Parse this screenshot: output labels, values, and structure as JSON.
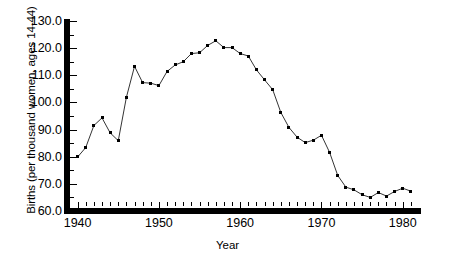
{
  "chart_data": {
    "type": "line",
    "title": "",
    "xlabel": "Year",
    "ylabel": "Births (per thousand women, ages 14-44)",
    "xlim": [
      1939.0,
      1982.0
    ],
    "ylim": [
      60.0,
      130.0
    ],
    "grid": false,
    "legend": "none",
    "marker": "square",
    "line_color": "#000000",
    "marker_color": "#000000",
    "x_tick_labels": [
      "1940",
      "1950",
      "1960",
      "1970",
      "1980"
    ],
    "x_major_ticks": [
      1940,
      1950,
      1960,
      1970,
      1980
    ],
    "x_minor_tick_step": 1,
    "y_tick_labels": [
      "60.0",
      "70.0",
      "80.0",
      "90.0",
      "100.0",
      "110.0",
      "120.0",
      "130.0"
    ],
    "y_major_ticks": [
      60.0,
      70.0,
      80.0,
      90.0,
      100.0,
      110.0,
      120.0,
      130.0
    ],
    "y_minor_tick_step": 5,
    "x": [
      1940,
      1941,
      1942,
      1943,
      1944,
      1945,
      1946,
      1947,
      1948,
      1949,
      1950,
      1951,
      1952,
      1953,
      1954,
      1955,
      1956,
      1957,
      1958,
      1959,
      1960,
      1961,
      1962,
      1963,
      1964,
      1965,
      1966,
      1967,
      1968,
      1969,
      1970,
      1971,
      1972,
      1973,
      1974,
      1975,
      1976,
      1977,
      1978,
      1979,
      1980,
      1981
    ],
    "values": [
      79.9,
      83.4,
      91.5,
      94.3,
      88.8,
      85.9,
      101.9,
      113.3,
      107.3,
      107.1,
      106.2,
      111.4,
      113.8,
      115.0,
      118.0,
      118.3,
      121.0,
      122.7,
      120.2,
      120.2,
      118.0,
      117.1,
      112.0,
      108.3,
      104.7,
      96.3,
      90.8,
      87.2,
      85.2,
      86.1,
      87.9,
      81.6,
      73.1,
      68.8,
      67.8,
      66.0,
      65.0,
      66.8,
      65.5,
      67.2,
      68.4,
      67.3
    ],
    "series_name": "Births per thousand women ages 14-44"
  },
  "axis": {
    "y_title": "Births (per thousand women, ages 14-44)",
    "x_title": "Year"
  }
}
